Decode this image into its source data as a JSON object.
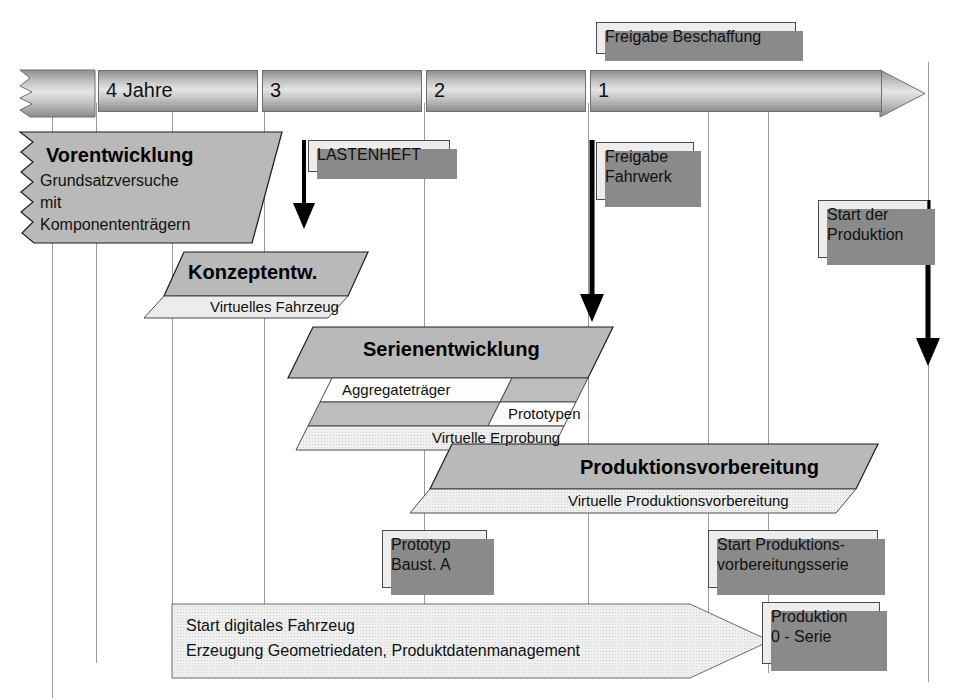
{
  "diagram": {
    "timeline": {
      "name": "years-countdown-axis",
      "segments": [
        {
          "label": "",
          "kind": "zigzag-start"
        },
        {
          "label": "4 Jahre"
        },
        {
          "label": "3"
        },
        {
          "label": "2"
        },
        {
          "label": "1"
        }
      ]
    },
    "phases": [
      {
        "id": "vorentwicklung",
        "title": "Vorentwicklung",
        "lines": [
          "Grundsatzversuche",
          "mit",
          "Komponententrägern"
        ],
        "subbands": []
      },
      {
        "id": "konzeptentwicklung",
        "title": "Konzeptentw.",
        "subbands": [
          {
            "label": "Virtuelles Fahrzeug"
          }
        ]
      },
      {
        "id": "serienentwicklung",
        "title": "Serienentwicklung",
        "subbands": [
          {
            "label": "Aggregateträger"
          },
          {
            "label": "Prototypen"
          },
          {
            "label": "Virtuelle Erprobung"
          }
        ]
      },
      {
        "id": "produktionsvorbereitung",
        "title": "Produktionsvorbereitung",
        "subbands": [
          {
            "label": "Virtuelle Produktionsvorbereitung"
          }
        ]
      }
    ],
    "milestones": [
      {
        "id": "freigabe-beschaffung",
        "lines": [
          "Freigabe Beschaffung"
        ]
      },
      {
        "id": "lastenheft",
        "lines": [
          "LASTENHEFT"
        ]
      },
      {
        "id": "freigabe-fahrwerk",
        "lines": [
          "Freigabe",
          "Fahrwerk"
        ]
      },
      {
        "id": "start-der-produktion",
        "lines": [
          "Start der",
          "Produktion"
        ]
      },
      {
        "id": "prototyp-baustufe-a",
        "lines": [
          "Prototyp",
          "Baust. A"
        ]
      },
      {
        "id": "start-produktionsvorbereitungsserie",
        "lines": [
          "Start Produktions-",
          "vorbereitungsserie"
        ]
      },
      {
        "id": "produktion-null-serie",
        "lines": [
          "Produktion",
          "0 - Serie"
        ]
      }
    ],
    "footer_banner": {
      "id": "digitales-fahrzeug-banner",
      "lines": [
        "Start digitales Fahrzeug",
        "Erzeugung Geometriedaten, Produktdatenmanagement"
      ]
    },
    "colors": {
      "band_main": "#b9b9b9",
      "band_sub_light": "#ececec",
      "band_sub_mid": "#bdbdbd",
      "band_sub_white": "#fdfdfd",
      "callout_fill": "#ededed",
      "callout_shadow": "#8a8a8a",
      "gridline": "#9a9a9a",
      "ink": "#000000"
    }
  }
}
